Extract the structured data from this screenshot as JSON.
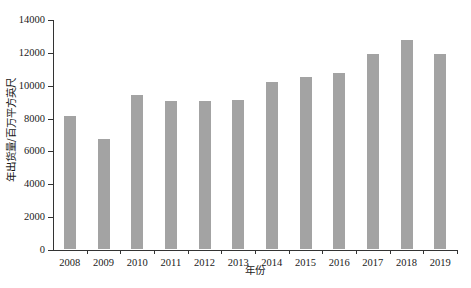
{
  "chart_data": {
    "type": "bar",
    "title": "",
    "xlabel": "年份",
    "ylabel": "年出货量/百万平方英尺",
    "categories": [
      "2008",
      "2009",
      "2010",
      "2011",
      "2012",
      "2013",
      "2014",
      "2015",
      "2016",
      "2017",
      "2018",
      "2019"
    ],
    "values": [
      8100,
      6700,
      9400,
      9000,
      9000,
      9100,
      10150,
      10450,
      10700,
      11850,
      12750,
      11850
    ],
    "series": [
      {
        "name": "年出货量",
        "values": [
          8100,
          6700,
          9400,
          9000,
          9000,
          9100,
          10150,
          10450,
          10700,
          11850,
          12750,
          11850
        ]
      }
    ],
    "ylim": [
      0,
      14000
    ],
    "ytick_labels": [
      "0",
      "2000",
      "4000",
      "6000",
      "8000",
      "10000",
      "12000",
      "14000"
    ],
    "ytick_values": [
      0,
      2000,
      4000,
      6000,
      8000,
      10000,
      12000,
      14000
    ],
    "grid": false,
    "legend": false,
    "legend_position": "none",
    "bar_color": "#a3a3a3",
    "axis_color": "#333333",
    "background_color": "#ffffff"
  }
}
